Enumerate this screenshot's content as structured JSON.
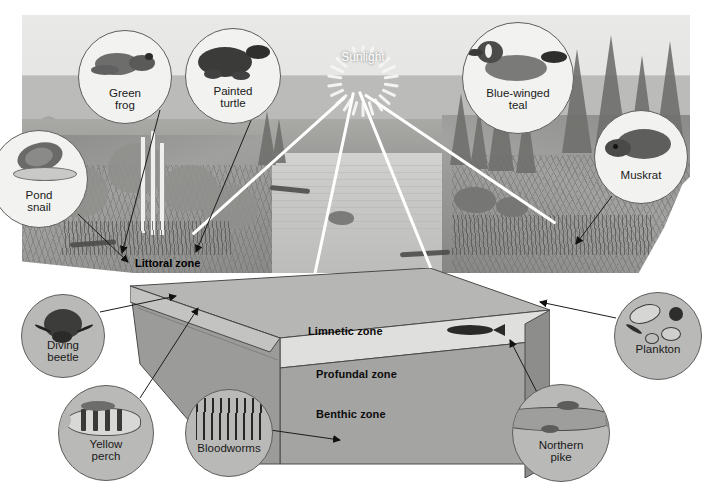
{
  "figure": {
    "type": "labeled-illustration"
  },
  "sun": {
    "label": "Sunlight",
    "ray_count": 22,
    "label_color": "#ffffff"
  },
  "zones": [
    {
      "id": "littoral",
      "label": "Littoral zone",
      "color": "#0b0b0b",
      "bold": true
    },
    {
      "id": "limnetic",
      "label": "Limnetic zone",
      "color": "#0b0b0b",
      "bold": true
    },
    {
      "id": "profundal",
      "label": "Profundal zone",
      "color": "#0b0b0b",
      "bold": true
    },
    {
      "id": "benthic",
      "label": "Benthic zone",
      "color": "#0b0b0b",
      "bold": true
    }
  ],
  "organisms": [
    {
      "id": "green-frog",
      "line1": "Green",
      "line2": "frog",
      "fill": "light"
    },
    {
      "id": "painted-turtle",
      "line1": "Painted",
      "line2": "turtle",
      "fill": "light"
    },
    {
      "id": "pond-snail",
      "line1": "Pond",
      "line2": "snail",
      "fill": "light"
    },
    {
      "id": "blue-winged-teal",
      "line1": "Blue-winged",
      "line2": "teal",
      "fill": "light"
    },
    {
      "id": "muskrat",
      "line1": "Muskrat",
      "line2": "",
      "fill": "light"
    },
    {
      "id": "diving-beetle",
      "line1": "Diving",
      "line2": "beetle",
      "fill": "gray"
    },
    {
      "id": "yellow-perch",
      "line1": "Yellow",
      "line2": "perch",
      "fill": "gray"
    },
    {
      "id": "bloodworms",
      "line1": "Bloodworms",
      "line2": "",
      "fill": "gray"
    },
    {
      "id": "northern-pike",
      "line1": "Northern",
      "line2": "pike",
      "fill": "gray"
    },
    {
      "id": "plankton",
      "line1": "Plankton",
      "line2": "",
      "fill": "gray"
    }
  ],
  "colors": {
    "water_surface": "#b3b3b1",
    "limnetic_band": "#dcdcda",
    "profundal_face": "#a0a09e",
    "side_face": "#8f8f8d",
    "outline": "#3a3a38",
    "beam": "#ffffff",
    "label_dark": "#0b0b0b",
    "page_background": "#ffffff"
  }
}
